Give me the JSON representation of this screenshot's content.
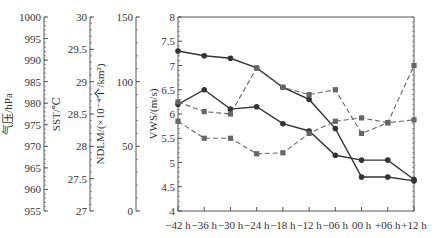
{
  "chart_data": {
    "type": "line",
    "title": "",
    "xlabel": "",
    "categories": [
      "−42 h",
      "−36 h",
      "−30 h",
      "−24 h",
      "−18 h",
      "−12 h",
      "−06 h",
      "00 h",
      "+06 h",
      "+12 h"
    ],
    "axes": [
      {
        "id": "pressure",
        "label": "气压/hPa",
        "ticks": [
          "1000",
          "995",
          "990",
          "985",
          "980",
          "975",
          "970",
          "965",
          "960",
          "955"
        ],
        "range": [
          955,
          1000
        ]
      },
      {
        "id": "sst",
        "label": "SST/℃",
        "ticks": [
          "30",
          "29.5",
          "29",
          "28.5",
          "28",
          "27.5",
          "27"
        ],
        "range": [
          27,
          30
        ]
      },
      {
        "id": "ndlm",
        "label": "NDLM/(×10⁻⁴个/km²)",
        "ticks": [
          "150",
          "100",
          "50",
          "0"
        ],
        "range": [
          0,
          150
        ]
      },
      {
        "id": "vws",
        "label": "VWS/(m/s)",
        "ticks": [
          "8",
          "7.5",
          "7",
          "6.5",
          "6",
          "5.5",
          "5",
          "4.5",
          "4"
        ],
        "range": [
          4,
          8
        ]
      }
    ],
    "ylim": [
      4,
      8
    ],
    "grid": false,
    "legend": "none",
    "series": [
      {
        "name": "series-a-solid",
        "style": "solid",
        "marker": "circle",
        "values": [
          7.3,
          7.2,
          7.15,
          6.95,
          6.55,
          6.3,
          5.7,
          4.7,
          4.7,
          4.62
        ]
      },
      {
        "name": "series-b-solid",
        "style": "solid",
        "marker": "circle",
        "values": [
          6.2,
          6.5,
          6.1,
          6.15,
          5.8,
          5.65,
          5.15,
          5.05,
          5.05,
          4.65
        ]
      },
      {
        "name": "series-c-dashed",
        "style": "dashed",
        "marker": "square",
        "values": [
          6.25,
          6.05,
          6.0,
          6.95,
          6.55,
          6.4,
          6.5,
          5.6,
          5.82,
          7.0
        ]
      },
      {
        "name": "series-d-dashed",
        "style": "dashed",
        "marker": "square",
        "values": [
          5.85,
          5.5,
          5.5,
          5.18,
          5.2,
          5.6,
          5.85,
          5.92,
          5.82,
          5.88
        ]
      }
    ]
  },
  "colors": {
    "solid": "#333333",
    "dashed": "#666666",
    "axis": "#555555"
  }
}
